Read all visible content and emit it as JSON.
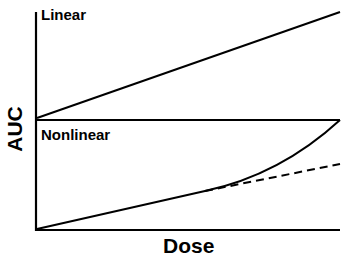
{
  "diagram": {
    "x_axis_label": "Dose",
    "y_axis_label": "AUC",
    "panels": [
      {
        "label": "Linear",
        "description": "straight line increasing with dose"
      },
      {
        "label": "Nonlinear",
        "description": "curve rising above dashed linear extrapolation at higher doses"
      }
    ],
    "line_color": "#000000",
    "background": "#ffffff"
  }
}
